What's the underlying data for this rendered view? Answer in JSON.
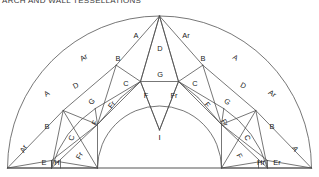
{
  "title": "ARCH AND WALL TESSELLATIONS",
  "figure": {
    "name": "semicircular-arch-tessellation",
    "colors": {
      "stroke": "#4a4a4a",
      "baseline": "#555555",
      "background": "#ffffff",
      "text": "#1b1b1b"
    },
    "geometry": {
      "center_x": 159.5,
      "baseline_y": 160,
      "outer_radius": 152,
      "inner_radius": 62,
      "baseline_x0": 7,
      "baseline_x1": 312
    },
    "inner_label": "I",
    "labels": [
      {
        "id": "L-Ar-outer",
        "text": "Ar",
        "x": 24,
        "y": 141,
        "rot": -62
      },
      {
        "id": "L-E",
        "text": "E",
        "x": 44,
        "y": 155,
        "rot": 0
      },
      {
        "id": "L-H",
        "text": "H",
        "x": 57,
        "y": 155,
        "rot": 0
      },
      {
        "id": "L-Fr-low",
        "text": "Fr",
        "x": 80,
        "y": 148,
        "rot": -62
      },
      {
        "id": "L-B-left",
        "text": "B",
        "x": 47,
        "y": 119,
        "rot": 0
      },
      {
        "id": "L-C-left",
        "text": "C",
        "x": 72,
        "y": 130,
        "rot": -72
      },
      {
        "id": "L-F-left",
        "text": "F",
        "x": 95,
        "y": 115,
        "rot": -62
      },
      {
        "id": "L-A-left",
        "text": "A",
        "x": 47,
        "y": 86,
        "rot": -34
      },
      {
        "id": "L-D-left",
        "text": "D",
        "x": 76,
        "y": 78,
        "rot": -28
      },
      {
        "id": "L-G-left",
        "text": "G",
        "x": 92,
        "y": 94,
        "rot": -40
      },
      {
        "id": "L-Fr-left",
        "text": "Fr",
        "x": 112,
        "y": 97,
        "rot": -52
      },
      {
        "id": "L-Ar-left",
        "text": "Ar",
        "x": 84,
        "y": 50,
        "rot": -30
      },
      {
        "id": "L-B-ul",
        "text": "B",
        "x": 118,
        "y": 51,
        "rot": 0
      },
      {
        "id": "L-C-ul",
        "text": "C",
        "x": 126,
        "y": 76,
        "rot": 0
      },
      {
        "id": "L-A-top-l",
        "text": "A",
        "x": 136,
        "y": 28,
        "rot": 0
      },
      {
        "id": "L-D-apex",
        "text": "D",
        "x": 160,
        "y": 41,
        "rot": 0
      },
      {
        "id": "L-G-apex",
        "text": "G",
        "x": 160,
        "y": 67,
        "rot": 0
      },
      {
        "id": "L-F-cl",
        "text": "F",
        "x": 146,
        "y": 88,
        "rot": 0
      },
      {
        "id": "L-Fr-cr",
        "text": "Fr",
        "x": 174,
        "y": 88,
        "rot": 0
      },
      {
        "id": "L-Ar-top-r",
        "text": "Ar",
        "x": 186,
        "y": 28,
        "rot": 0
      },
      {
        "id": "L-B-ur",
        "text": "B",
        "x": 203,
        "y": 51,
        "rot": 0
      },
      {
        "id": "L-C-ur",
        "text": "C",
        "x": 195,
        "y": 76,
        "rot": 0
      },
      {
        "id": "L-A-right",
        "text": "A",
        "x": 235,
        "y": 50,
        "rot": 30
      },
      {
        "id": "L-D-right",
        "text": "D",
        "x": 243,
        "y": 78,
        "rot": 28
      },
      {
        "id": "L-G-right",
        "text": "G",
        "x": 227,
        "y": 94,
        "rot": 40
      },
      {
        "id": "L-F-right",
        "text": "F",
        "x": 207,
        "y": 97,
        "rot": 52
      },
      {
        "id": "L-Ar-right",
        "text": "Ar",
        "x": 272,
        "y": 86,
        "rot": 34
      },
      {
        "id": "L-Fr-right",
        "text": "Fr",
        "x": 224,
        "y": 115,
        "rot": 62
      },
      {
        "id": "L-B-right",
        "text": "B",
        "x": 272,
        "y": 119,
        "rot": 0
      },
      {
        "id": "L-C-right",
        "text": "C",
        "x": 247,
        "y": 130,
        "rot": 72
      },
      {
        "id": "L-F-low-r",
        "text": "F",
        "x": 239,
        "y": 148,
        "rot": 62
      },
      {
        "id": "L-Hr",
        "text": "Hr",
        "x": 261,
        "y": 155,
        "rot": 0
      },
      {
        "id": "L-Er",
        "text": "Er",
        "x": 277,
        "y": 155,
        "rot": 0
      },
      {
        "id": "L-A-outer-r",
        "text": "A",
        "x": 295,
        "y": 141,
        "rot": 62
      }
    ],
    "legend_terms": [
      "A",
      "Ar",
      "B",
      "C",
      "D",
      "E",
      "Er",
      "F",
      "Fr",
      "G",
      "H",
      "Hr",
      "I"
    ]
  }
}
